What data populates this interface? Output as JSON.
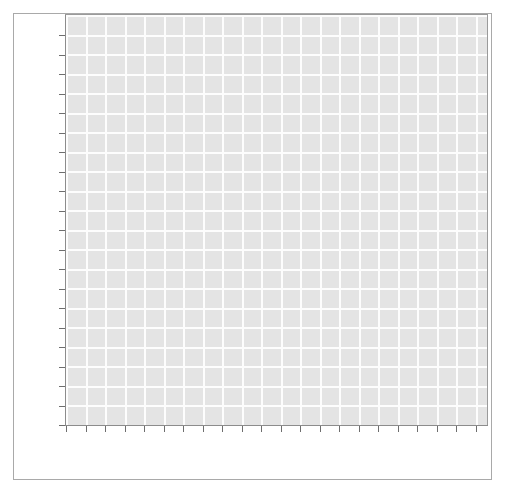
{
  "figure": {
    "width": 507,
    "height": 495,
    "background_color": "#ffffff",
    "frame_border_color": "#a9a9a9"
  },
  "chart_data": {
    "type": "line",
    "title": "",
    "subtitle": "",
    "xlabel": "",
    "ylabel": "",
    "series": [],
    "x": [],
    "categories": [],
    "values": [],
    "annotations": [],
    "legend": {
      "visible": false,
      "position": "none",
      "entries": []
    },
    "grid": {
      "visible": true,
      "color": "#fdfdfd",
      "axis": "both",
      "x_gridline_count": 21,
      "y_gridline_count": 21,
      "x_spacing_px": 19.5,
      "y_spacing_px": 19.5
    },
    "plot_background_color": "#e4e4e4",
    "axis": {
      "spine_color": "#8c8c8c",
      "tick_color": "#6e6e6e",
      "tick_direction": "out",
      "tick_length_px": 6,
      "x_tick_count": 22,
      "y_tick_count": 21,
      "x_tick_labels": [
        "",
        "",
        "",
        "",
        "",
        "",
        "",
        "",
        "",
        "",
        "",
        "",
        "",
        "",
        "",
        "",
        "",
        "",
        "",
        "",
        "",
        ""
      ],
      "y_tick_labels": [
        "",
        "",
        "",
        "",
        "",
        "",
        "",
        "",
        "",
        "",
        "",
        "",
        "",
        "",
        "",
        "",
        "",
        "",
        "",
        "",
        ""
      ]
    },
    "xlim": [
      0,
      21
    ],
    "ylim": [
      0,
      21
    ],
    "note": "Empty plot canvas: gridded axes rendered with no data series, no tick labels, no title."
  }
}
